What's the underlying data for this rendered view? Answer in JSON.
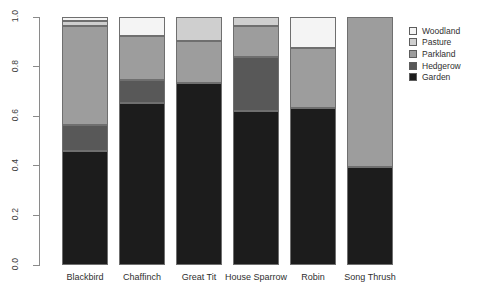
{
  "chart_data": {
    "type": "bar",
    "stacked": true,
    "title": "",
    "xlabel": "",
    "ylabel": "",
    "ylim": [
      0,
      1
    ],
    "grid": false,
    "legend_position": "right",
    "categories": [
      "Blackbird",
      "Chaffinch",
      "Great Tit",
      "House Sparrow",
      "Robin",
      "Song Thrush"
    ],
    "ytick_labels": [
      "0.0",
      "0.2",
      "0.4",
      "0.6",
      "0.8",
      "1.0"
    ],
    "ytick_values": [
      0.0,
      0.2,
      0.4,
      0.6,
      0.8,
      1.0
    ],
    "series": [
      {
        "name": "Garden",
        "color": "#1c1c1c",
        "values": [
          0.46,
          0.655,
          0.735,
          0.62,
          0.635,
          0.395
        ]
      },
      {
        "name": "Hedgerow",
        "color": "#585858",
        "values": [
          0.105,
          0.09,
          0.0,
          0.22,
          0.0,
          0.0
        ]
      },
      {
        "name": "Parkland",
        "color": "#9d9d9d",
        "values": [
          0.4,
          0.18,
          0.17,
          0.125,
          0.24,
          0.605
        ]
      },
      {
        "name": "Pasture",
        "color": "#cfcfcf",
        "values": [
          0.02,
          0.0,
          0.095,
          0.035,
          0.0,
          0.0
        ]
      },
      {
        "name": "Woodland",
        "color": "#f4f4f4",
        "values": [
          0.015,
          0.075,
          0.0,
          0.0,
          0.125,
          0.0
        ]
      }
    ]
  },
  "legend": {
    "items": [
      {
        "label": "Woodland",
        "color": "#f4f4f4"
      },
      {
        "label": "Pasture",
        "color": "#cfcfcf"
      },
      {
        "label": "Parkland",
        "color": "#9d9d9d"
      },
      {
        "label": "Hedgerow",
        "color": "#585858"
      },
      {
        "label": "Garden",
        "color": "#1c1c1c"
      }
    ]
  }
}
